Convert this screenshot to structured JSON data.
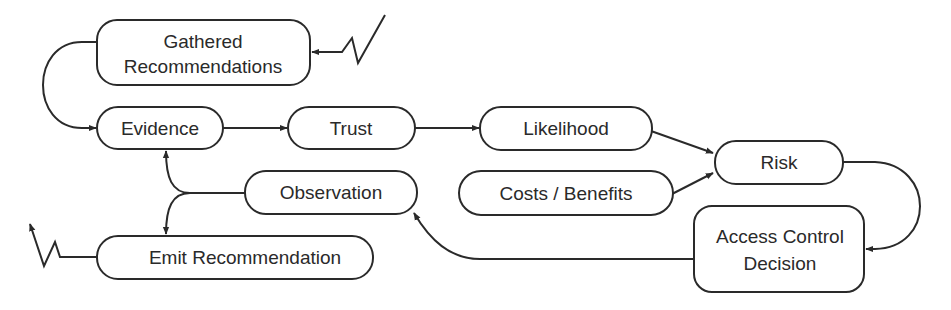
{
  "diagram": {
    "nodes": {
      "gathered": {
        "lines": [
          "Gathered",
          "Recommendations"
        ]
      },
      "evidence": {
        "label": "Evidence"
      },
      "trust": {
        "label": "Trust"
      },
      "likelihood": {
        "label": "Likelihood"
      },
      "risk": {
        "label": "Risk"
      },
      "costs": {
        "label": "Costs / Benefits"
      },
      "observation": {
        "label": "Observation"
      },
      "access": {
        "lines": [
          "Access Control",
          "Decision"
        ]
      },
      "emit": {
        "label": "Emit Recommendation"
      }
    },
    "edges": [
      {
        "from": "external-input",
        "to": "gathered",
        "style": "lightning"
      },
      {
        "from": "gathered",
        "to": "evidence"
      },
      {
        "from": "evidence",
        "to": "trust"
      },
      {
        "from": "trust",
        "to": "likelihood"
      },
      {
        "from": "likelihood",
        "to": "risk"
      },
      {
        "from": "costs",
        "to": "risk"
      },
      {
        "from": "risk",
        "to": "access"
      },
      {
        "from": "access",
        "to": "observation"
      },
      {
        "from": "observation",
        "to": "evidence"
      },
      {
        "from": "observation",
        "to": "emit"
      },
      {
        "from": "emit",
        "to": "external-output",
        "style": "lightning"
      }
    ],
    "colors": {
      "stroke": "#2a2a2a",
      "background": "#ffffff"
    }
  }
}
